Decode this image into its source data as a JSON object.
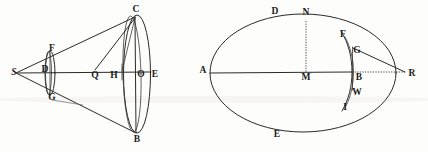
{
  "figure": {
    "ink_color": "#2a2a28",
    "paper_color": "#fdfdfb",
    "left_diagram": {
      "name": "cone-and-sections",
      "description": "Apex S with two generating lines meeting a large ellipse through C, O, B, E; a small ellipse near F, D, G; axis S to E with points Q, H, O",
      "labels": [
        {
          "id": "S",
          "text": "S",
          "x": 14,
          "y": 73,
          "italic": true
        },
        {
          "id": "F",
          "text": "F",
          "x": 52,
          "y": 49,
          "italic": false
        },
        {
          "id": "D",
          "text": "D",
          "x": 45,
          "y": 70,
          "italic": false
        },
        {
          "id": "G",
          "text": "G",
          "x": 52,
          "y": 98,
          "italic": false
        },
        {
          "id": "C",
          "text": "C",
          "x": 136,
          "y": 10,
          "italic": false
        },
        {
          "id": "Q",
          "text": "Q",
          "x": 95,
          "y": 76,
          "italic": false
        },
        {
          "id": "H",
          "text": "H",
          "x": 114,
          "y": 76,
          "italic": false
        },
        {
          "id": "O",
          "text": "O",
          "x": 141,
          "y": 75,
          "italic": false
        },
        {
          "id": "E",
          "text": "E",
          "x": 155,
          "y": 75,
          "italic": false
        },
        {
          "id": "B",
          "text": "B",
          "x": 137,
          "y": 140,
          "italic": false
        }
      ]
    },
    "right_diagram": {
      "name": "ellipse-with-tangent",
      "description": "Large ellipse with major axis A to B through centre M, top point D and apex N, bottom point E; small arc F G B W I at the right vertex; lines from G and B converge at R",
      "labels": [
        {
          "id": "D",
          "text": "D",
          "x": 275,
          "y": 12,
          "italic": false
        },
        {
          "id": "N",
          "text": "N",
          "x": 306,
          "y": 13,
          "italic": false
        },
        {
          "id": "F",
          "text": "F",
          "x": 343,
          "y": 35,
          "italic": false
        },
        {
          "id": "G",
          "text": "G",
          "x": 357,
          "y": 51,
          "italic": false
        },
        {
          "id": "A",
          "text": "A",
          "x": 203,
          "y": 71,
          "italic": false
        },
        {
          "id": "M",
          "text": "M",
          "x": 306,
          "y": 76,
          "italic": false
        },
        {
          "id": "B",
          "text": "B",
          "x": 358,
          "y": 78,
          "italic": false
        },
        {
          "id": "R",
          "text": "R",
          "x": 412,
          "y": 74,
          "italic": false
        },
        {
          "id": "W",
          "text": "W",
          "x": 357,
          "y": 93,
          "italic": false
        },
        {
          "id": "I",
          "text": "I",
          "x": 345,
          "y": 108,
          "italic": false
        },
        {
          "id": "E",
          "text": "E",
          "x": 277,
          "y": 135,
          "italic": false
        }
      ]
    }
  }
}
